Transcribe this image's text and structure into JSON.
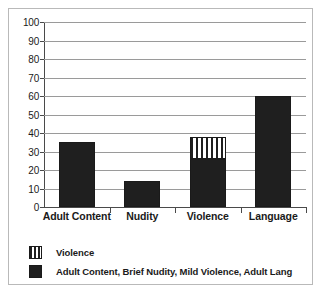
{
  "chart_data": {
    "type": "bar",
    "title": "",
    "subtitle": "",
    "xlabel": "",
    "ylabel": "",
    "ylim": [
      0,
      100
    ],
    "ytick_step": 10,
    "yticks": [
      100,
      90,
      80,
      70,
      60,
      50,
      40,
      30,
      20,
      10,
      0
    ],
    "grid": true,
    "legend_position": "bottom-left",
    "stacked": true,
    "categories": [
      "Adult Content",
      "Nudity",
      "Violence",
      "Language"
    ],
    "series": [
      {
        "name": "Adult Content, Brief Nudity,  Mild Violence, Adult Lang",
        "fill": "solid-black",
        "color": "#1f1f1f",
        "values": [
          35,
          14,
          26,
          60
        ]
      },
      {
        "name": "Violence",
        "fill": "vertical-stripes",
        "color": "#1f1f1f",
        "values": [
          0,
          0,
          12,
          0
        ]
      }
    ],
    "totals": [
      35,
      14,
      38,
      60
    ]
  },
  "axis": {
    "y_tick_labels": [
      "100",
      "90",
      "80",
      "70",
      "60",
      "50",
      "40",
      "30",
      "20",
      "10",
      "0"
    ],
    "x_tick_labels": [
      "Adult Content",
      "Nudity",
      "Violence",
      "Language"
    ]
  },
  "legend": {
    "items": [
      {
        "label": "Violence",
        "swatch": "striped-swatch"
      },
      {
        "label": "Adult Content, Brief Nudity,  Mild Violence, Adult Lang",
        "swatch": "solid-swatch"
      }
    ]
  },
  "colors": {
    "bar": "#1f1f1f",
    "gridline": "#9a9a9a",
    "axis": "#4a4a4a",
    "border": "#b9b9b9",
    "background": "#ffffff"
  }
}
